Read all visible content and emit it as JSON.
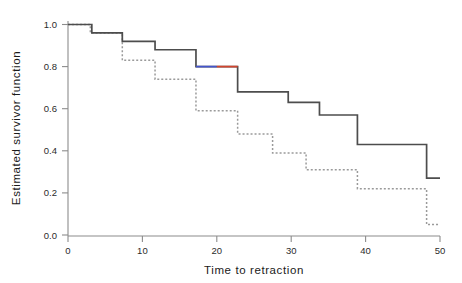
{
  "chart_data": {
    "type": "line",
    "title": "",
    "xlabel": "Time to retraction",
    "ylabel": "Estimated survivor function",
    "xlim": [
      0,
      50
    ],
    "ylim": [
      0.0,
      1.0
    ],
    "xticks": [
      0,
      10,
      20,
      30,
      40,
      50
    ],
    "xtick_labels": [
      "0",
      "10",
      "20",
      "30",
      "40",
      "50"
    ],
    "yticks": [
      0.0,
      0.2,
      0.4,
      0.6,
      0.8,
      1.0
    ],
    "ytick_labels": [
      "0.0",
      "0.2",
      "0.4",
      "0.6",
      "0.8",
      "1.0"
    ],
    "grid": false,
    "legend": "none",
    "step_type": "post",
    "series": [
      {
        "name": "solid-survivor-curve",
        "style": "solid",
        "color": "#4d4d4d",
        "x": [
          0,
          3.2,
          7.3,
          11.7,
          17.2,
          22.8,
          29.6,
          33.8,
          38.9,
          48.2,
          50
        ],
        "y": [
          1.0,
          0.96,
          0.92,
          0.88,
          0.8,
          0.68,
          0.63,
          0.57,
          0.43,
          0.27,
          0.27
        ]
      },
      {
        "name": "dotted-survivor-curve",
        "style": "dotted",
        "color": "#9a9a9a",
        "x": [
          0,
          3.0,
          7.3,
          11.7,
          17.2,
          22.8,
          27.5,
          32.0,
          38.9,
          48.2,
          50
        ],
        "y": [
          1.0,
          0.96,
          0.83,
          0.74,
          0.59,
          0.48,
          0.39,
          0.31,
          0.22,
          0.05,
          0.05
        ]
      }
    ],
    "highlight_segments": [
      {
        "name": "blue-highlight-segment",
        "color": "#4455cc",
        "x_start": 17.2,
        "x_end": 20.0,
        "y": 0.8
      },
      {
        "name": "red-highlight-segment",
        "color": "#d2452f",
        "x_start": 20.0,
        "x_end": 22.8,
        "y": 0.8
      }
    ]
  }
}
